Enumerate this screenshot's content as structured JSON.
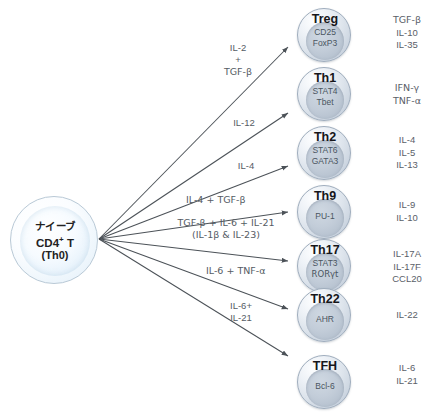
{
  "diagram": {
    "title_faint": "",
    "source_cell": {
      "line1": "ナイーブ",
      "line2_pre": "CD4",
      "line2_sup": "+",
      "line2_post": " T",
      "line3": "(Th0)"
    },
    "arrow_color": "#4c5258",
    "cell_accent": "#b4c0cf",
    "naive_accent": "#e2eef8"
  },
  "lineages": [
    {
      "name": "Treg",
      "factors": [
        "CD25",
        "FoxP3"
      ],
      "signal": [
        "IL-2",
        "+",
        "TGF-β"
      ],
      "outputs": [
        "TGF-β",
        "IL-10",
        "IL-35"
      ]
    },
    {
      "name": "Th1",
      "factors": [
        "STAT4",
        "Tbet"
      ],
      "signal": [
        "IL-12"
      ],
      "outputs": [
        "IFN-γ",
        "TNF-α"
      ]
    },
    {
      "name": "Th2",
      "factors": [
        "STAT6",
        "GATA3"
      ],
      "signal": [
        "IL-4"
      ],
      "outputs": [
        "IL-4",
        "IL-5",
        "IL-13"
      ]
    },
    {
      "name": "Th9",
      "factors": [
        "PU-1"
      ],
      "signal": [
        "IL-4 + TGF-β"
      ],
      "outputs": [
        "IL-9",
        "IL-10"
      ]
    },
    {
      "name": "Th17",
      "factors": [
        "STAT3",
        "RORγt"
      ],
      "signal": [
        "TGF-β + IL-6 + IL-21",
        "(IL-1β  &  IL-23)"
      ],
      "outputs": [
        "IL-17A",
        "IL-17F",
        "CCL20"
      ]
    },
    {
      "name": "Th22",
      "factors": [
        "AHR"
      ],
      "signal": [
        "IL-6 + TNF-α"
      ],
      "outputs": [
        "IL-22"
      ]
    },
    {
      "name": "TFH",
      "factors": [
        "Bcl-6"
      ],
      "signal": [
        "IL-6+",
        "IL-21"
      ],
      "outputs": [
        "IL-6",
        "IL-21"
      ]
    }
  ]
}
